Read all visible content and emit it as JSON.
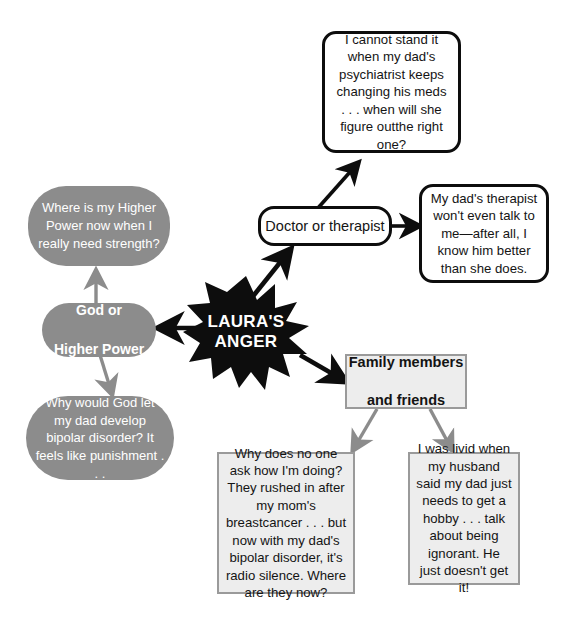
{
  "diagram": {
    "center": {
      "label": "LAURA'S\nANGER",
      "line1": "LAURA'S",
      "line2": "ANGER",
      "shape": "starburst",
      "fill": "#0d0d0d",
      "text_color": "#ffffff"
    },
    "branches": [
      {
        "id": "god",
        "label": "God or\nHigher Power",
        "line1": "God or",
        "line2": "Higher Power",
        "shape": "rounded-oval",
        "fill": "#8c8c8c",
        "text_color": "#ffffff"
      },
      {
        "id": "doctor",
        "label": "Doctor or therapist",
        "shape": "rounded-rect",
        "fill": "#ffffff",
        "text_color": "#141414"
      },
      {
        "id": "family",
        "label": "Family members\nand friends",
        "line1": "Family members",
        "line2": "and friends",
        "shape": "rect",
        "fill": "#ededed",
        "text_color": "#141414"
      }
    ],
    "statements": [
      {
        "id": "god-up",
        "parent": "god",
        "text": "Where is my Higher Power now when I really need strength?",
        "fill": "#8c8c8c",
        "text_color": "#ffffff"
      },
      {
        "id": "god-down",
        "parent": "god",
        "text": "Why would God let my dad develop bipolar disorder? It feels like punishment . . .",
        "fill": "#8c8c8c",
        "text_color": "#ffffff"
      },
      {
        "id": "doctor-up",
        "parent": "doctor",
        "text": "I cannot stand it when my dad's psychiatrist keeps changing his meds . . . when will she figure outthe right one?",
        "fill": "#ffffff",
        "text_color": "#141414"
      },
      {
        "id": "doctor-right",
        "parent": "doctor",
        "text": "My dad's therapist won't even talk to me—after all, I know him better than she does.",
        "fill": "#ffffff",
        "text_color": "#141414"
      },
      {
        "id": "family-left",
        "parent": "family",
        "text": "Why does no one ask how I'm doing? They rushed in after my mom's breastcancer . . . but now with my dad's bipolar disorder, it's radio silence. Where are they now?",
        "fill": "#ededed",
        "text_color": "#141414"
      },
      {
        "id": "family-right",
        "parent": "family",
        "text": "I was livid when my husband said my dad just needs to get a hobby . . . talk about being ignorant. He just doesn't get it!",
        "fill": "#ededed",
        "text_color": "#141414"
      }
    ],
    "colors": {
      "black": "#0d0d0d",
      "medium_gray": "#8c8c8c",
      "light_gray": "#ededed",
      "gray_border": "#9a9a9a",
      "background": "#ffffff"
    }
  }
}
